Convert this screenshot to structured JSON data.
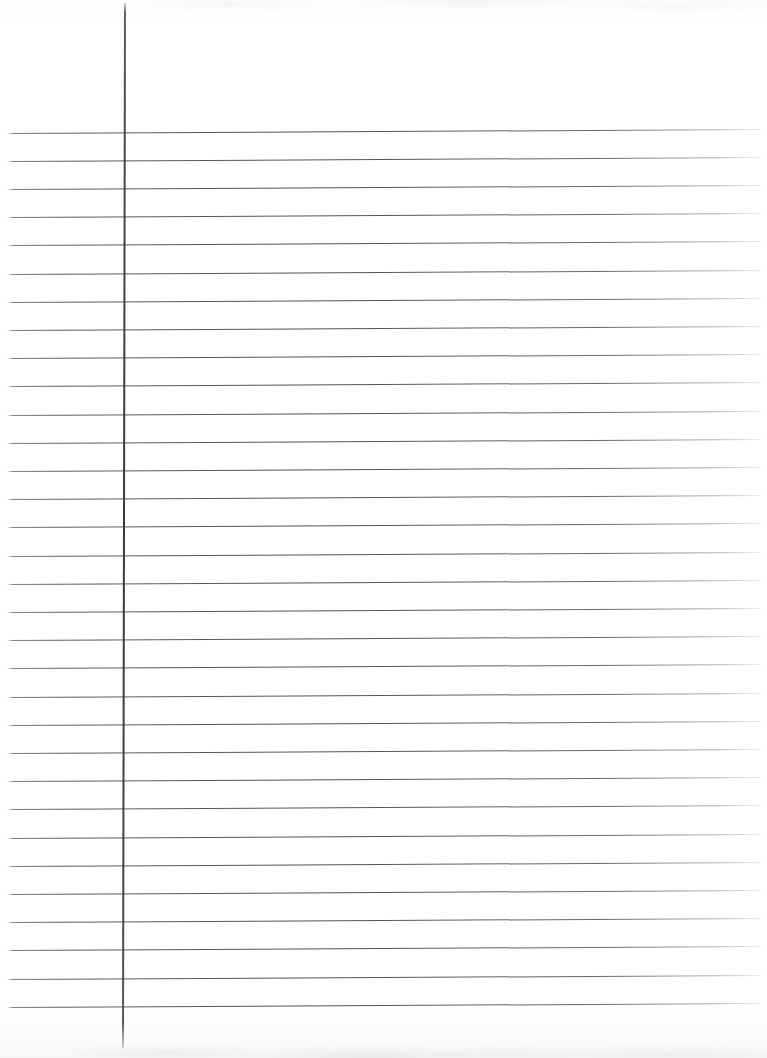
{
  "document": {
    "type": "scanned-image",
    "subject": "blank ruled notebook paper",
    "orientation": "portrait",
    "width_px": 767,
    "height_px": 1058,
    "background_color": "#fefefe",
    "text_content": "",
    "has_handwriting": false,
    "has_printed_text": false
  },
  "paper": {
    "name": "lined-paper-sheet",
    "paper_color": "#fefefe",
    "edge_artifact_top": true,
    "edge_artifact_bottom": true
  },
  "ruling": {
    "rule_color": "#4e4e52",
    "margin_rule_color": "#3a3a3e",
    "horizontal_line_count": 32,
    "line_spacing_px": 28.2,
    "first_line_y": 133,
    "last_line_y": 1007,
    "line_start_x": 7,
    "line_end_x": 761,
    "line_tilt_deg": -0.3,
    "header_blank_height_px": 133,
    "margin_rule": {
      "name": "left-margin-rule",
      "x_top": 124,
      "x_bottom": 122,
      "y_start": 3,
      "y_end": 1048,
      "width_px": 2,
      "tilt_deg": 0.11
    },
    "horizontal_lines": [
      {
        "index": 1,
        "y": 133
      },
      {
        "index": 2,
        "y": 161
      },
      {
        "index": 3,
        "y": 189
      },
      {
        "index": 4,
        "y": 217
      },
      {
        "index": 5,
        "y": 245
      },
      {
        "index": 6,
        "y": 274
      },
      {
        "index": 7,
        "y": 302
      },
      {
        "index": 8,
        "y": 330
      },
      {
        "index": 9,
        "y": 358
      },
      {
        "index": 10,
        "y": 386
      },
      {
        "index": 11,
        "y": 415
      },
      {
        "index": 12,
        "y": 443
      },
      {
        "index": 13,
        "y": 471
      },
      {
        "index": 14,
        "y": 499
      },
      {
        "index": 15,
        "y": 527
      },
      {
        "index": 16,
        "y": 556
      },
      {
        "index": 17,
        "y": 584
      },
      {
        "index": 18,
        "y": 612
      },
      {
        "index": 19,
        "y": 640
      },
      {
        "index": 20,
        "y": 668
      },
      {
        "index": 21,
        "y": 697
      },
      {
        "index": 22,
        "y": 725
      },
      {
        "index": 23,
        "y": 753
      },
      {
        "index": 24,
        "y": 781
      },
      {
        "index": 25,
        "y": 809
      },
      {
        "index": 26,
        "y": 838
      },
      {
        "index": 27,
        "y": 866
      },
      {
        "index": 28,
        "y": 894
      },
      {
        "index": 29,
        "y": 922
      },
      {
        "index": 30,
        "y": 950
      },
      {
        "index": 31,
        "y": 979
      },
      {
        "index": 32,
        "y": 1007
      }
    ]
  }
}
